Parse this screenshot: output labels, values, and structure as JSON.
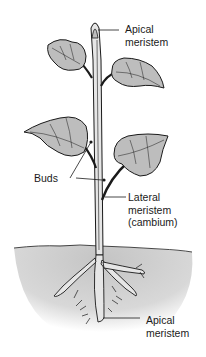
{
  "diagram": {
    "labels": {
      "apical_top": [
        "Apical",
        "meristem"
      ],
      "buds": "Buds",
      "lateral": [
        "Lateral",
        "meristem",
        "(cambium)"
      ],
      "apical_root": [
        "Apical",
        "meristem"
      ]
    },
    "colors": {
      "ink": "#1a1a1a",
      "leaf_fill": "#bdbdbd",
      "stem_fill": "#e6e6e6",
      "soil": "#cfcfcf",
      "background": "#ffffff"
    }
  }
}
